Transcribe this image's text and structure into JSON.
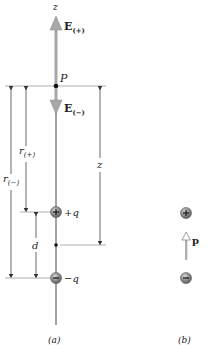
{
  "figure": {
    "panel_a": {
      "caption": "(a)",
      "axis_label": "z",
      "point_label": "P",
      "field_up": {
        "symbol": "E",
        "subscript": "(+)"
      },
      "field_down": {
        "symbol": "E",
        "subscript": "(−)"
      },
      "r_plus": {
        "symbol": "r",
        "subscript": "(+)"
      },
      "r_minus": {
        "symbol": "r",
        "subscript": "(−)"
      },
      "distance_z": "z",
      "separation_d": "d",
      "positive_charge_label": "+q",
      "negative_charge_label": "−q"
    },
    "panel_b": {
      "caption": "(b)",
      "dipole_moment_label": "p"
    },
    "colors": {
      "axis_line": "#555555",
      "field_arrow": "#a0a0a0",
      "charge_fill": "#8a8a8a",
      "dim_line": "#444444"
    }
  }
}
